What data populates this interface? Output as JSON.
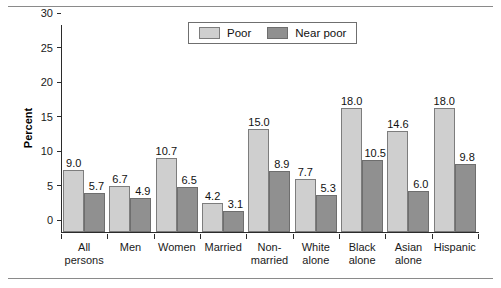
{
  "chart_data": {
    "type": "bar",
    "title": "",
    "xlabel": "",
    "ylabel": "Percent",
    "ylim": [
      0,
      30
    ],
    "yticks": [
      0,
      5,
      10,
      15,
      20,
      25,
      30
    ],
    "grid": false,
    "legend_position": "top-center",
    "categories": [
      "All persons",
      "Men",
      "Women",
      "Married",
      "Non-married",
      "White alone",
      "Black alone",
      "Asian alone",
      "Hispanic"
    ],
    "category_lines": [
      [
        "All",
        "persons"
      ],
      [
        "Men",
        ""
      ],
      [
        "Women",
        ""
      ],
      [
        "Married",
        ""
      ],
      [
        "Non-",
        "married"
      ],
      [
        "White",
        "alone"
      ],
      [
        "Black",
        "alone"
      ],
      [
        "Asian",
        "alone"
      ],
      [
        "Hispanic",
        ""
      ]
    ],
    "series": [
      {
        "name": "Poor",
        "color": "#cfcfcf",
        "values": [
          9.0,
          6.7,
          10.7,
          4.2,
          15.0,
          7.7,
          18.0,
          14.6,
          18.0
        ],
        "labels": [
          "9.0",
          "6.7",
          "10.7",
          "4.2",
          "15.0",
          "7.7",
          "18.0",
          "14.6",
          "18.0"
        ]
      },
      {
        "name": "Near poor",
        "color": "#909090",
        "values": [
          5.7,
          4.9,
          6.5,
          3.1,
          8.9,
          5.3,
          10.5,
          6.0,
          9.8
        ],
        "labels": [
          "5.7",
          "4.9",
          "6.5",
          "3.1",
          "8.9",
          "5.3",
          "10.5",
          "6.0",
          "9.8"
        ]
      }
    ]
  },
  "legend": {
    "items": [
      {
        "label": "Poor"
      },
      {
        "label": "Near poor"
      }
    ]
  },
  "axis": {
    "y_title": "Percent",
    "y_tick_labels": [
      "30",
      "25",
      "20",
      "15",
      "10",
      "5",
      "0"
    ]
  }
}
